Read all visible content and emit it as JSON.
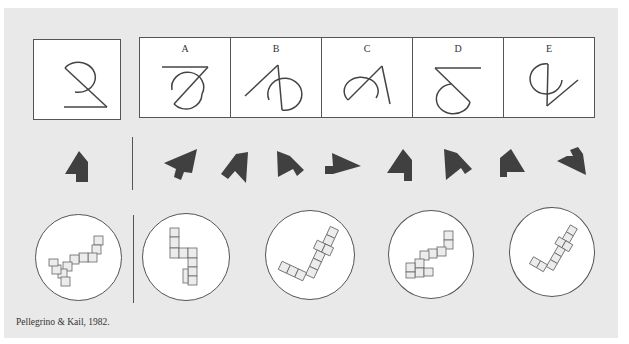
{
  "figure": {
    "background_color": "#e9e9e9",
    "ink_color": "#444444",
    "shape_fill": "#404040",
    "row1": {
      "description": "Line-drawing rotation test: target figure and five alternatives",
      "target": {
        "name": "target-figure"
      },
      "options": [
        {
          "label": "A"
        },
        {
          "label": "B"
        },
        {
          "label": "C"
        },
        {
          "label": "D"
        },
        {
          "label": "E"
        }
      ]
    },
    "row2": {
      "description": "Polygon rotation test: target shape and eight rotated/mirrored alternatives",
      "target": {
        "name": "target-polygon"
      },
      "option_count": 8
    },
    "row3": {
      "description": "3D cube-figure rotation test: target and four alternatives",
      "target": {
        "name": "target-cube-figure"
      },
      "option_count": 4
    },
    "caption": "Pellegrino & Kail, 1982."
  }
}
